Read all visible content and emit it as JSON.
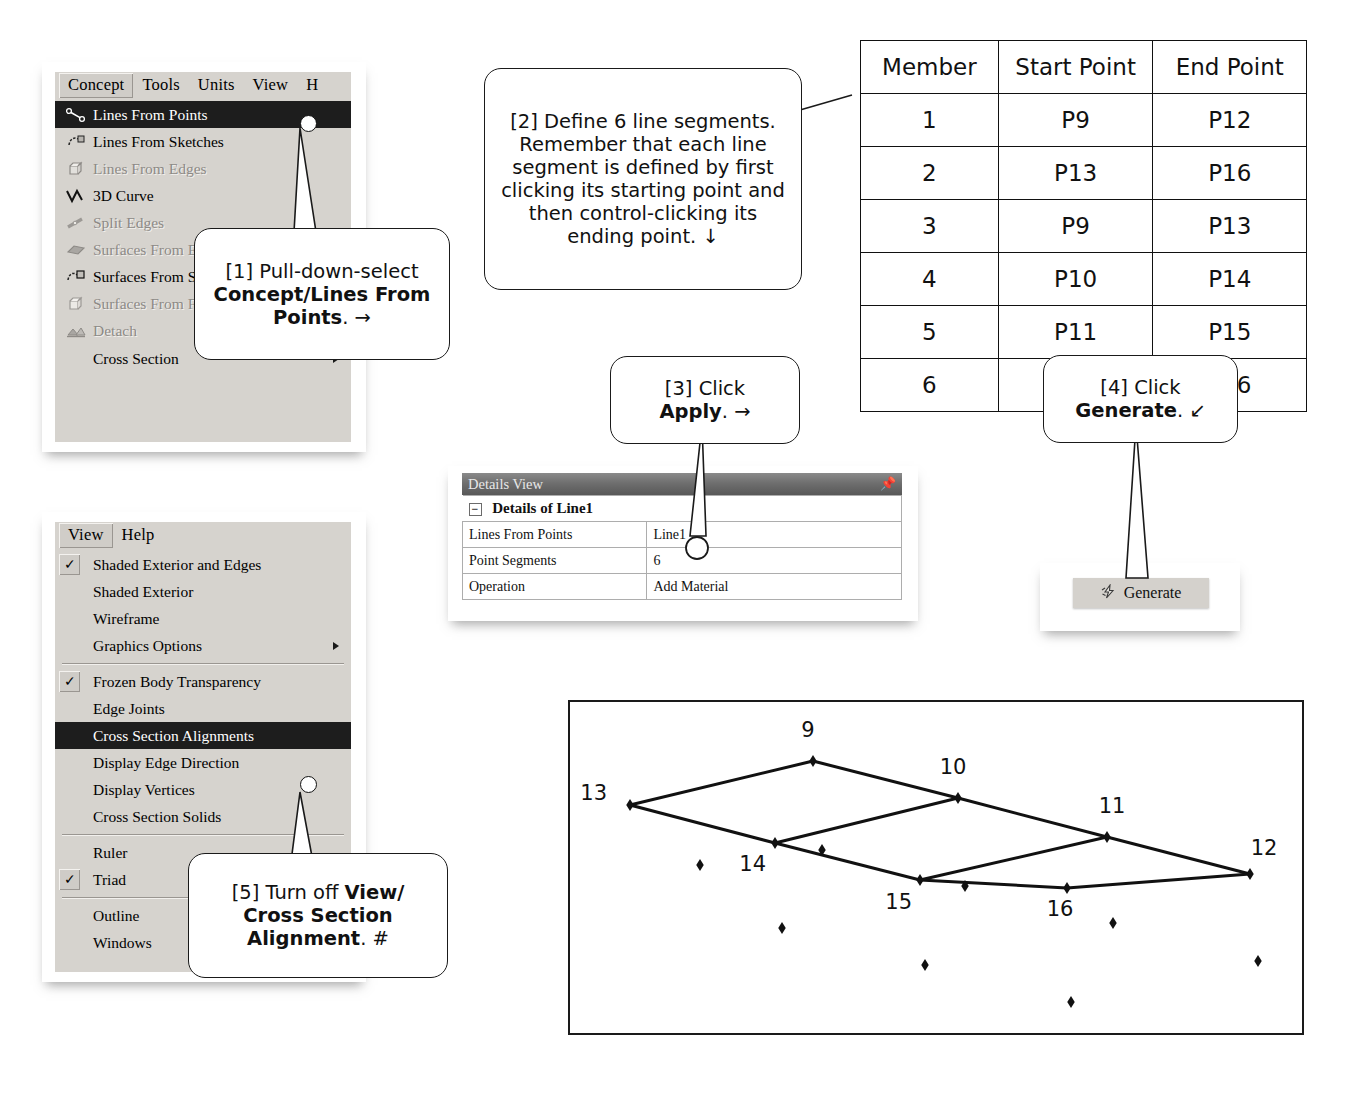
{
  "concept_menu": {
    "menubar": [
      {
        "label": "Concept",
        "selected": true
      },
      {
        "label": "Tools",
        "selected": false
      },
      {
        "label": "Units",
        "selected": false
      },
      {
        "label": "View",
        "selected": false
      },
      {
        "label": "H",
        "selected": false
      }
    ],
    "items": [
      {
        "label": "Lines From Points",
        "icon": "lines-from-points-icon",
        "state": "highlighted",
        "submenu": false
      },
      {
        "label": "Lines From Sketches",
        "icon": "lines-from-sketches-icon",
        "state": "enabled",
        "submenu": false
      },
      {
        "label": "Lines From Edges",
        "icon": "lines-from-edges-icon",
        "state": "disabled",
        "submenu": false
      },
      {
        "label": "3D Curve",
        "icon": "3d-curve-icon",
        "state": "enabled",
        "submenu": false
      },
      {
        "label": "Split Edges",
        "icon": "split-edges-icon",
        "state": "disabled",
        "submenu": false
      },
      {
        "label": "Surfaces From Edges",
        "icon": "surfaces-from-edges-icon",
        "state": "disabled",
        "submenu": false
      },
      {
        "label": "Surfaces From Sketches",
        "icon": "surfaces-from-sketches-icon",
        "state": "enabled",
        "submenu": false
      },
      {
        "label": "Surfaces From Faces",
        "icon": "surfaces-from-faces-icon",
        "state": "disabled",
        "submenu": false
      },
      {
        "label": "Detach",
        "icon": "detach-icon",
        "state": "disabled",
        "submenu": false
      },
      {
        "label": "Cross Section",
        "icon": "none",
        "state": "enabled",
        "submenu": true
      }
    ]
  },
  "view_menu": {
    "menubar": [
      {
        "label": "View",
        "selected": true
      },
      {
        "label": "Help",
        "selected": false
      }
    ],
    "items": [
      {
        "label": "Shaded Exterior and Edges",
        "checked": true,
        "state": "enabled",
        "submenu": false,
        "sep_after": false
      },
      {
        "label": "Shaded Exterior",
        "checked": false,
        "state": "enabled",
        "submenu": false,
        "sep_after": false
      },
      {
        "label": "Wireframe",
        "checked": false,
        "state": "enabled",
        "submenu": false,
        "sep_after": false
      },
      {
        "label": "Graphics Options",
        "checked": false,
        "state": "enabled",
        "submenu": true,
        "sep_after": true
      },
      {
        "label": "Frozen Body Transparency",
        "checked": true,
        "state": "enabled",
        "submenu": false,
        "sep_after": false
      },
      {
        "label": "Edge Joints",
        "checked": false,
        "state": "enabled",
        "submenu": false,
        "sep_after": false
      },
      {
        "label": "Cross Section Alignments",
        "checked": false,
        "state": "highlighted",
        "submenu": false,
        "sep_after": false
      },
      {
        "label": "Display Edge Direction",
        "checked": false,
        "state": "enabled",
        "submenu": false,
        "sep_after": false
      },
      {
        "label": "Display Vertices",
        "checked": false,
        "state": "enabled",
        "submenu": false,
        "sep_after": false
      },
      {
        "label": "Cross Section Solids",
        "checked": false,
        "state": "enabled",
        "submenu": false,
        "sep_after": true
      },
      {
        "label": "Ruler",
        "checked": false,
        "state": "enabled",
        "submenu": false,
        "sep_after": false
      },
      {
        "label": "Triad",
        "checked": true,
        "state": "enabled",
        "submenu": false,
        "sep_after": true
      },
      {
        "label": "Outline",
        "checked": false,
        "state": "enabled",
        "submenu": false,
        "sep_after": false
      },
      {
        "label": "Windows",
        "checked": false,
        "state": "enabled",
        "submenu": false,
        "sep_after": false
      }
    ]
  },
  "callouts": {
    "c1": {
      "prefix": "[1] Pull-down-select ",
      "bold": "Concept/Lines From Points",
      "suffix": ". →"
    },
    "c2": {
      "text": "[2] Define 6 line segments. Remember that each line segment is defined by first clicking its starting point and then control-clicking its ending point. ↓"
    },
    "c3": {
      "prefix": "[3] Click ",
      "bold": "Apply",
      "suffix": ". →"
    },
    "c4": {
      "prefix": "[4] Click ",
      "bold": "Generate",
      "suffix": ". ↙"
    },
    "c5": {
      "prefix": "[5] Turn off ",
      "bold": "View/ Cross Section Alignment",
      "suffix": ". #"
    }
  },
  "member_table": {
    "headers": [
      "Member",
      "Start Point",
      "End Point"
    ],
    "rows": [
      [
        "1",
        "P9",
        "P12"
      ],
      [
        "2",
        "P13",
        "P16"
      ],
      [
        "3",
        "P9",
        "P13"
      ],
      [
        "4",
        "P10",
        "P14"
      ],
      [
        "5",
        "P11",
        "P15"
      ],
      [
        "6",
        "P12",
        "P16"
      ]
    ]
  },
  "details_view": {
    "title": "Details View",
    "pin_icon": "pushpin-icon",
    "expander": "−",
    "section": "Details of Line1",
    "rows": [
      {
        "name": "Lines From Points",
        "value": "Line1"
      },
      {
        "name": "Point Segments",
        "value": "6"
      },
      {
        "name": "Operation",
        "value": "Add Material"
      }
    ]
  },
  "generate_button": {
    "label": "Generate",
    "icon": "lightning-bolt-icon"
  },
  "geometry": {
    "nodes": [
      {
        "id": "9",
        "x": 813,
        "y": 761,
        "lx": 808,
        "ly": 737,
        "anchor": "middle"
      },
      {
        "id": "10",
        "x": 958,
        "y": 798,
        "lx": 953,
        "ly": 774,
        "anchor": "middle"
      },
      {
        "id": "11",
        "x": 1107,
        "y": 837,
        "lx": 1112,
        "ly": 813,
        "anchor": "middle"
      },
      {
        "id": "12",
        "x": 1250,
        "y": 874,
        "lx": 1264,
        "ly": 855,
        "anchor": "middle"
      },
      {
        "id": "13",
        "x": 630,
        "y": 805,
        "lx": 607,
        "ly": 800,
        "anchor": "end"
      },
      {
        "id": "14",
        "x": 775,
        "y": 843,
        "lx": 766,
        "ly": 871,
        "anchor": "end"
      },
      {
        "id": "15",
        "x": 920,
        "y": 880,
        "lx": 912,
        "ly": 909,
        "anchor": "end"
      },
      {
        "id": "16",
        "x": 1067,
        "y": 888,
        "lx": 1060,
        "ly": 916,
        "anchor": "middle"
      }
    ],
    "edges": [
      [
        "9",
        "13"
      ],
      [
        "9",
        "10"
      ],
      [
        "10",
        "11"
      ],
      [
        "11",
        "12"
      ],
      [
        "13",
        "14"
      ],
      [
        "14",
        "15"
      ],
      [
        "15",
        "16"
      ],
      [
        "16",
        "12"
      ],
      [
        "10",
        "14"
      ],
      [
        "11",
        "15"
      ]
    ],
    "free_points": [
      {
        "x": 822,
        "y": 850
      },
      {
        "x": 782,
        "y": 928
      },
      {
        "x": 700,
        "y": 865
      },
      {
        "x": 965,
        "y": 886
      },
      {
        "x": 925,
        "y": 965
      },
      {
        "x": 1113,
        "y": 923
      },
      {
        "x": 1258,
        "y": 961
      },
      {
        "x": 1071,
        "y": 1002
      }
    ]
  }
}
